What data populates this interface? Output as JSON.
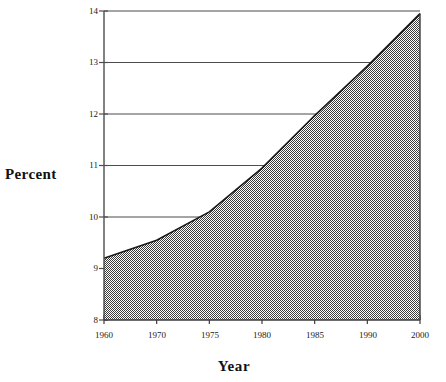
{
  "chart_data": {
    "type": "area",
    "title": "",
    "xlabel": "Year",
    "ylabel": "Percent",
    "categories": [
      "1960",
      "1970",
      "1975",
      "1980",
      "1985",
      "1990",
      "2000"
    ],
    "values": [
      9.2,
      9.55,
      10.1,
      10.95,
      11.97,
      12.93,
      13.95
    ],
    "series": [
      {
        "name": "Percent",
        "values": [
          9.2,
          9.55,
          10.1,
          10.95,
          11.97,
          12.93,
          13.95
        ]
      }
    ],
    "ylim": [
      8,
      14
    ],
    "yticks": [
      "8",
      "9",
      "10",
      "11",
      "12",
      "13",
      "14"
    ],
    "xticks": [
      "1960",
      "1970",
      "1975",
      "1980",
      "1985",
      "1990",
      "2000"
    ],
    "grid": "horizontal",
    "legend": "none",
    "axis_note": "x axis categories are equally spaced, not linear in time",
    "colors": {
      "fill": "#8a8a8a",
      "line": "#1a1a1a",
      "axis": "#4d4d4d",
      "grid": "#4d4d4d",
      "text": "#111111",
      "background": "#ffffff"
    }
  }
}
